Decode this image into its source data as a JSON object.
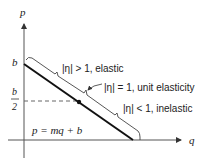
{
  "diagram": {
    "type": "linear demand curve elasticity",
    "axes": {
      "y_label": "p",
      "x_label": "q"
    },
    "intercept_label": "b",
    "midpoint_label_numerator": "b",
    "midpoint_label_denominator": "2",
    "equation": "p = mq + b",
    "regions": [
      {
        "label": "|η| > 1, elastic"
      },
      {
        "label": "|η| = 1, unit elasticity"
      },
      {
        "label": "|η| < 1, inelastic"
      }
    ],
    "colors": {
      "axis": "#555555",
      "demand_line": "#111111",
      "bracket": "#444444",
      "dashed": "#666666"
    }
  }
}
